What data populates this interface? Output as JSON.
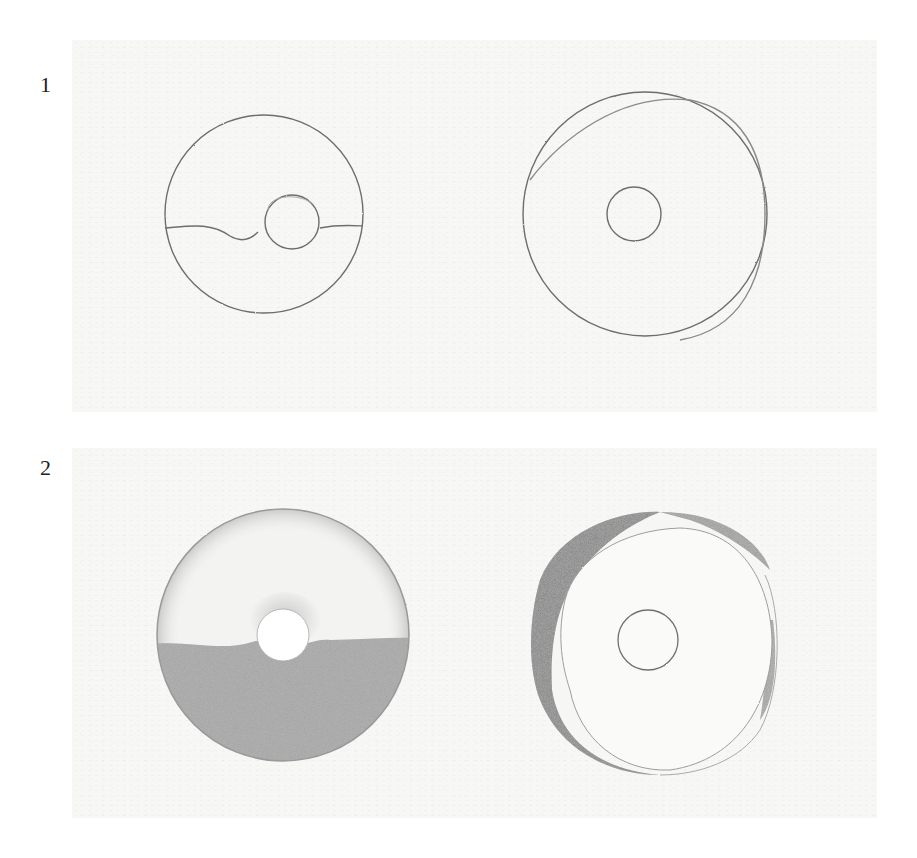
{
  "steps": [
    {
      "number": "1",
      "description": "Outline sketches",
      "drawings": [
        {
          "name": "donut-outline-with-glaze-line",
          "center": [
            264,
            214
          ],
          "outer_radius": 100,
          "hole_radius": 28
        },
        {
          "name": "donut-outline-with-offset-rim",
          "center": [
            645,
            214
          ],
          "outer_radius": 124,
          "hole_radius": 30
        }
      ]
    },
    {
      "number": "2",
      "description": "Shading applied",
      "drawings": [
        {
          "name": "donut-half-shaded",
          "center": [
            283,
            635
          ],
          "outer_radius": 126,
          "hole_radius": 26
        },
        {
          "name": "donut-rim-shaded",
          "center": [
            657,
            640
          ],
          "outer_radius": 126,
          "hole_radius": 30
        }
      ]
    }
  ],
  "colors": {
    "paper": "#f7f7f6",
    "pencil_line": "#6e6e6e",
    "shading": "#a3a3a3",
    "dark_shading": "#6a6a6a"
  }
}
